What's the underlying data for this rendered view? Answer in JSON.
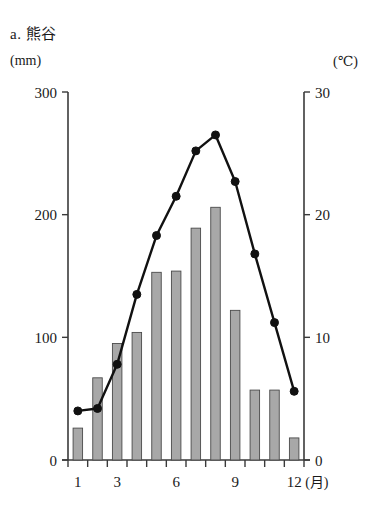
{
  "chart_title": "a. 熊谷",
  "axis_units": {
    "left": "(mm)",
    "right": "(℃)",
    "x": "(月)"
  },
  "axes": {
    "left_ticks": [
      "0",
      "100",
      "200",
      "300"
    ],
    "left_values": [
      0,
      100,
      200,
      300
    ],
    "right_ticks": [
      "0",
      "10",
      "20",
      "30"
    ],
    "right_values": [
      0,
      10,
      20,
      30
    ],
    "x_ticks": [
      "1",
      "3",
      "6",
      "9",
      "12"
    ],
    "x_tick_months": [
      1,
      3,
      6,
      9,
      12
    ]
  },
  "chart_data": {
    "type": "bar",
    "title": "a. 熊谷",
    "subtitle": "",
    "xlabel": "(月)",
    "ylabel": "(mm)",
    "y2label": "(℃)",
    "categories": [
      "1",
      "2",
      "3",
      "4",
      "5",
      "6",
      "7",
      "8",
      "9",
      "10",
      "11",
      "12"
    ],
    "ylim": [
      0,
      300
    ],
    "y2lim": [
      0,
      30
    ],
    "grid": false,
    "legend": "none",
    "series": [
      {
        "name": "降水量",
        "type": "bar",
        "axis": "left",
        "unit": "mm",
        "values": [
          26,
          67,
          95,
          104,
          153,
          154,
          189,
          206,
          122,
          57,
          57,
          18
        ]
      },
      {
        "name": "気温",
        "type": "line",
        "axis": "right",
        "unit": "℃",
        "values": [
          4.0,
          4.2,
          7.8,
          13.5,
          18.3,
          21.5,
          25.2,
          26.5,
          22.7,
          16.8,
          11.2,
          5.6
        ]
      }
    ],
    "colors": {
      "bar_fill": "#a8a8a8",
      "bar_stroke": "#4a4a4a",
      "line": "#111111",
      "axis": "#3a3a3a"
    }
  }
}
